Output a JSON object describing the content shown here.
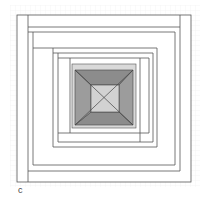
{
  "figure": {
    "label": "c",
    "colors": {
      "background": "#ffffff",
      "grid": "#ececec",
      "line": "#555555",
      "light_band": "#d9d9d9",
      "dark_top_bottom": "#8c8c8c",
      "dark_left_right": "#9c9c9c",
      "center": "#d2d2d2"
    }
  }
}
